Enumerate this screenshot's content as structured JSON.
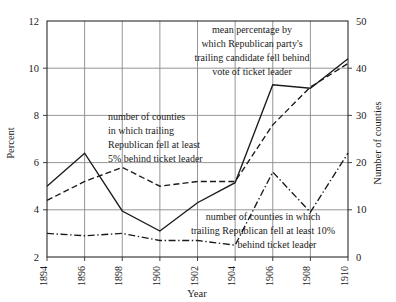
{
  "chart_data": {
    "type": "line",
    "title": "",
    "xlabel": "Year",
    "ylabel": "Percent",
    "y2label": "Number of counties",
    "x": [
      1894,
      1896,
      1898,
      1900,
      1902,
      1904,
      1906,
      1908,
      1910
    ],
    "xtick_labels": [
      "1894",
      "1896",
      "1898",
      "1900",
      "1902",
      "1904",
      "1906",
      "1908",
      "1910"
    ],
    "ylim": [
      2,
      12
    ],
    "ytick_labels": [
      "2",
      "4",
      "6",
      "8",
      "10",
      "12"
    ],
    "ytick_values": [
      2,
      4,
      6,
      8,
      10,
      12
    ],
    "y2lim": [
      0,
      50
    ],
    "y2tick_labels": [
      "0",
      "10",
      "20",
      "30",
      "40",
      "50"
    ],
    "y2tick_values": [
      0,
      10,
      20,
      30,
      40,
      50
    ],
    "grid": true,
    "legend_position": "inline-annotations",
    "series": [
      {
        "name": "mean percentage by which Republican party's trailing candidate fell behind vote of ticket leader",
        "style": "solid",
        "axis": "left",
        "units": "percent",
        "values": [
          5.0,
          6.4,
          3.95,
          3.1,
          4.3,
          5.15,
          9.3,
          9.15,
          10.4
        ]
      },
      {
        "name": "number of counties in which trailing Republican fell at least 5% behind ticket leader",
        "style": "dashed",
        "axis": "right",
        "units": "counties",
        "values": [
          12,
          16,
          19,
          15,
          16,
          16,
          28,
          36,
          41
        ]
      },
      {
        "name": "number of counties in which trailing Republican fell at least 10% behind ticket leader",
        "style": "dash-dot",
        "axis": "right",
        "units": "counties",
        "values": [
          5,
          4.5,
          5,
          3.5,
          3.5,
          2.5,
          18,
          9.5,
          22
        ]
      }
    ],
    "annotations": [
      {
        "id": "annotation-mean-percentage",
        "lines": [
          "mean percentage by",
          "which Republican party's",
          "trailing candidate fell behind",
          "vote of ticket leader"
        ]
      },
      {
        "id": "annotation-counties-5-percent",
        "lines": [
          "number of counties",
          "in which trailing",
          "Republican fell at least",
          "5% behind ticket leader"
        ]
      },
      {
        "id": "annotation-counties-10-percent",
        "lines": [
          "number of counties in which",
          "trailing Republican fell at least 10%",
          "behind ticket leader"
        ]
      }
    ]
  }
}
